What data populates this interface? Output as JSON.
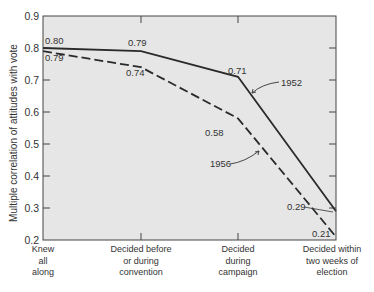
{
  "chart_data": {
    "type": "line",
    "title": "",
    "xlabel": "",
    "ylabel": "Multiple correlation of attitudes with vote",
    "ylim": [
      0.2,
      0.9
    ],
    "yticks": [
      "0.2",
      "0.3",
      "0.4",
      "0.5",
      "0.6",
      "0.7",
      "0.8",
      "0.9"
    ],
    "grid": false,
    "categories": [
      [
        "Knew",
        "all",
        "along"
      ],
      [
        "Decided before",
        "or during",
        "convention"
      ],
      [
        "Decided",
        "during",
        "campaign"
      ],
      [
        "Decided within",
        "two weeks of",
        "election"
      ]
    ],
    "series": [
      {
        "name": "1952",
        "style": "solid",
        "values": [
          0.8,
          0.79,
          0.71,
          0.29
        ],
        "labels": [
          "0.80",
          "0.79",
          "0.71",
          "0.29"
        ]
      },
      {
        "name": "1956",
        "style": "dashed",
        "values": [
          0.79,
          0.74,
          0.58,
          0.21
        ],
        "labels": [
          "0.79",
          "0.74",
          "0.58",
          "0.21"
        ]
      }
    ],
    "colors": {
      "plot_bg": "#e6e6e6",
      "line": "#2a2a2a",
      "text": "#333333"
    }
  }
}
